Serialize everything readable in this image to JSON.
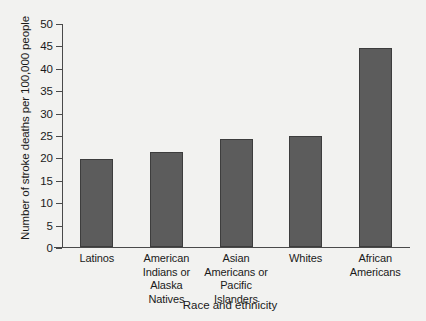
{
  "chart_data": {
    "type": "bar",
    "title": "",
    "subtitle": "",
    "xlabel": "Race and ethnicity",
    "ylabel": "Number of stroke deaths per 100,000 people",
    "categories": [
      "Latinos",
      "American\nIndians or\nAlaska\nNatives",
      "Asian\nAmericans or\nPacific Islanders",
      "Whites",
      "African\nAmericans"
    ],
    "values": [
      19.6,
      21.2,
      24.0,
      24.8,
      44.5
    ],
    "ylim": [
      0,
      50
    ],
    "yticks": [
      0,
      5,
      10,
      15,
      20,
      25,
      30,
      35,
      40,
      45,
      50
    ],
    "ytick_labels": [
      "0",
      "5",
      "10",
      "15",
      "20",
      "25",
      "30",
      "35",
      "40",
      "45",
      "50"
    ],
    "grid": false,
    "legend": null,
    "bar_color": "#5c5c5c",
    "bar_edge_color": "#3d3d3d",
    "background_color": "#f2f2f0",
    "axis_color": "#4a4a4a"
  }
}
